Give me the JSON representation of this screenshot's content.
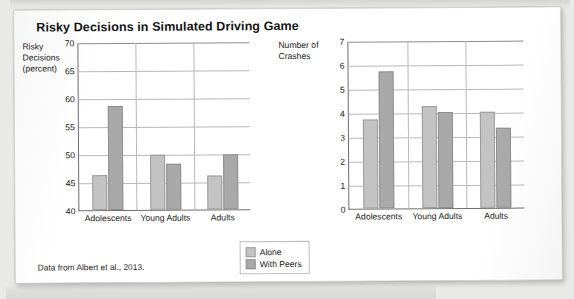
{
  "figure": {
    "title": "Risky Decisions in Simulated Driving Game",
    "source_note": "Data from Albert et al., 2013."
  },
  "legend": {
    "position": "bottom-center",
    "entries": [
      {
        "label": "Alone",
        "color": "#c3c3c3"
      },
      {
        "label": "With Peers",
        "color": "#a9a9a9"
      }
    ]
  },
  "chart_data": [
    {
      "type": "bar",
      "id": "risky-decisions",
      "title": "",
      "xlabel": "",
      "ylabel": "Risky Decisions (percent)",
      "ylabel_lines": [
        "Risky",
        "Decisions",
        "(percent)"
      ],
      "categories": [
        "Adolescents",
        "Young Adults",
        "Adults"
      ],
      "series": [
        {
          "name": "Alone",
          "color": "#c3c3c3",
          "values": [
            46.2,
            49.8,
            46.0
          ]
        },
        {
          "name": "With Peers",
          "color": "#a9a9a9",
          "values": [
            58.6,
            48.2,
            49.8
          ]
        }
      ],
      "ylim": [
        40,
        70
      ],
      "yticks": [
        40,
        45,
        50,
        55,
        60,
        65,
        70
      ],
      "grid": true,
      "group_separators": true
    },
    {
      "type": "bar",
      "id": "number-of-crashes",
      "title": "",
      "xlabel": "",
      "ylabel": "Number of Crashes",
      "ylabel_lines": [
        "Number of",
        "Crashes"
      ],
      "categories": [
        "Adolescents",
        "Young Adults",
        "Adults"
      ],
      "series": [
        {
          "name": "Alone",
          "color": "#c3c3c3",
          "values": [
            3.7,
            4.25,
            4.0
          ]
        },
        {
          "name": "With Peers",
          "color": "#a9a9a9",
          "values": [
            5.7,
            4.0,
            3.35
          ]
        }
      ],
      "ylim": [
        0,
        7
      ],
      "yticks": [
        0,
        1,
        2,
        3,
        4,
        5,
        6,
        7
      ],
      "grid": true,
      "group_separators": true
    }
  ]
}
